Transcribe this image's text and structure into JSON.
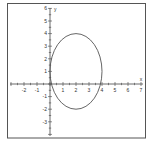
{
  "chart_data": {
    "type": "line",
    "title": "",
    "xlabel": "x",
    "ylabel": "y",
    "xlim": [
      -3,
      7
    ],
    "ylim": [
      -4,
      6
    ],
    "x_ticks": [
      -2,
      -1,
      0,
      1,
      2,
      3,
      4,
      5,
      6,
      7
    ],
    "y_ticks": [
      -3,
      -2,
      -1,
      1,
      2,
      3,
      4,
      5,
      6
    ],
    "x_tick_labels": [
      "-2",
      "-1",
      "",
      "1",
      "2",
      "3",
      "4",
      "5",
      "6",
      "7"
    ],
    "y_tick_labels": [
      "-3",
      "-2",
      "-1",
      "1",
      "2",
      "3",
      "4",
      "5",
      "6"
    ],
    "grid": false,
    "series": [
      {
        "name": "ellipse",
        "kind": "ellipse",
        "center": [
          2,
          1
        ],
        "semi_axis_x": 2,
        "semi_axis_y": 3,
        "equation": "(x-2)^2/4 + (y-1)^2/9 = 1",
        "color": "#555555"
      }
    ]
  }
}
